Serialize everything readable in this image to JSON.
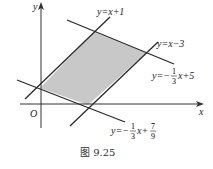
{
  "figure": {
    "caption": "图 9.25",
    "axes": {
      "x_label": "x",
      "y_label": "y",
      "origin_label": "O"
    },
    "lines": [
      {
        "id": "l1",
        "label_prefix": "y=x+1",
        "equation": "y=x+1"
      },
      {
        "id": "l2",
        "label_prefix": "y=x−3",
        "equation": "y=x-3"
      },
      {
        "id": "l3",
        "label_prefix": "y=−",
        "frac_num": "1",
        "frac_den": "3",
        "label_suffix": "x+5",
        "equation": "y=-1/3x+5"
      },
      {
        "id": "l4",
        "label_prefix": "y=−",
        "frac_num": "1",
        "frac_den": "3",
        "label_mid": "x+",
        "frac2_num": "7",
        "frac2_den": "9",
        "equation": "y=-1/3x+7/9"
      }
    ],
    "region": {
      "description": "shaded parallelogram bounded by the four lines",
      "fill": "#c8c8c8"
    },
    "colors": {
      "line": "#2a2a2a",
      "axis": "#333333",
      "shade": "#c8c8c8"
    }
  }
}
